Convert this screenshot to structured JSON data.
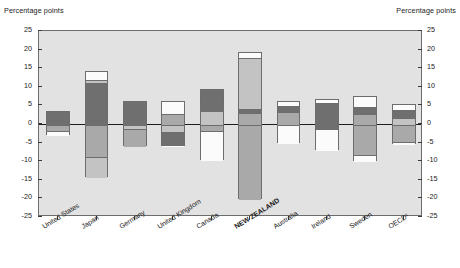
{
  "axis_titles": {
    "left": "Percentage points",
    "right": "Percentage points"
  },
  "chart_data": {
    "type": "bar",
    "subtype": "stacked-diverging",
    "title": "",
    "xlabel": "",
    "ylabel": "Percentage points",
    "ylim": [
      -25,
      25
    ],
    "yticks": [
      25,
      20,
      15,
      10,
      5,
      0,
      -5,
      -10,
      -15,
      -20,
      -25
    ],
    "ytick_labels": [
      "25",
      "20",
      "15",
      "10",
      "5",
      "0",
      "-5",
      "-10",
      "-15",
      "-20",
      "-25"
    ],
    "grid": false,
    "legend_position": "none",
    "categories": [
      "United States",
      "Japan",
      "Germany",
      "United Kingdom",
      "Canada",
      "NEW ZEALAND",
      "Australia",
      "Ireland",
      "Sweden",
      "OECD¹"
    ],
    "highlight_category": "NEW ZEALAND",
    "palette": {
      "white": "#fbfbfb",
      "light_gray": "#c3c3c3",
      "medium_gray": "#a9a9a9",
      "dark_gray": "#6f6f6f",
      "plot_background": "#e2e2e2",
      "outline": "#6d6d6d",
      "zero_line": "#1d1d1d",
      "text": "#1a1a1a"
    },
    "bars": [
      {
        "category": "United States",
        "total_positive": 3.4,
        "total_negative": -3.0,
        "segments": [
          {
            "from": 0.0,
            "to": 3.4,
            "color": "dark_gray"
          },
          {
            "from": -1.6,
            "to": 0.0,
            "color": "medium_gray"
          },
          {
            "from": -3.0,
            "to": -1.6,
            "color": "white"
          }
        ]
      },
      {
        "category": "Japan",
        "total_positive": 14.3,
        "total_negative": -14.2,
        "segments": [
          {
            "from": 12.0,
            "to": 14.3,
            "color": "white"
          },
          {
            "from": 11.4,
            "to": 12.0,
            "color": "light_gray"
          },
          {
            "from": 0.0,
            "to": 11.4,
            "color": "dark_gray"
          },
          {
            "from": -8.6,
            "to": 0.0,
            "color": "medium_gray"
          },
          {
            "from": -14.2,
            "to": -8.6,
            "color": "light_gray"
          }
        ]
      },
      {
        "category": "Germany",
        "total_positive": 6.2,
        "total_negative": -6.0,
        "segments": [
          {
            "from": 0.0,
            "to": 6.2,
            "color": "dark_gray"
          },
          {
            "from": -1.0,
            "to": 0.0,
            "color": "light_gray"
          },
          {
            "from": -6.0,
            "to": -1.0,
            "color": "medium_gray"
          }
        ]
      },
      {
        "category": "United Kingdom",
        "total_positive": 6.1,
        "total_negative": -6.0,
        "segments": [
          {
            "from": 2.9,
            "to": 6.1,
            "color": "white"
          },
          {
            "from": 0.0,
            "to": 2.9,
            "color": "medium_gray"
          },
          {
            "from": -2.0,
            "to": 0.0,
            "color": "light_gray"
          },
          {
            "from": -5.4,
            "to": -2.0,
            "color": "dark_gray"
          },
          {
            "from": -6.0,
            "to": -5.4,
            "color": "white"
          }
        ]
      },
      {
        "category": "Canada",
        "total_positive": 9.5,
        "total_negative": -9.6,
        "segments": [
          {
            "from": 3.8,
            "to": 9.5,
            "color": "dark_gray"
          },
          {
            "from": 0.0,
            "to": 3.8,
            "color": "light_gray"
          },
          {
            "from": -1.6,
            "to": 0.0,
            "color": "medium_gray"
          },
          {
            "from": -9.6,
            "to": -1.6,
            "color": "white"
          }
        ]
      },
      {
        "category": "NEW ZEALAND",
        "total_positive": 19.4,
        "total_negative": -20.2,
        "segments": [
          {
            "from": 18.0,
            "to": 19.4,
            "color": "white"
          },
          {
            "from": 4.2,
            "to": 18.0,
            "color": "light_gray"
          },
          {
            "from": 3.2,
            "to": 4.2,
            "color": "dark_gray"
          },
          {
            "from": 0.0,
            "to": 3.2,
            "color": "medium_gray"
          },
          {
            "from": -20.2,
            "to": 0.0,
            "color": "medium_gray"
          }
        ]
      },
      {
        "category": "Australia",
        "total_positive": 6.2,
        "total_negative": -5.0,
        "segments": [
          {
            "from": 5.0,
            "to": 6.2,
            "color": "white"
          },
          {
            "from": 3.4,
            "to": 5.0,
            "color": "dark_gray"
          },
          {
            "from": 0.0,
            "to": 3.4,
            "color": "medium_gray"
          },
          {
            "from": -5.0,
            "to": 0.0,
            "color": "white"
          }
        ]
      },
      {
        "category": "Ireland",
        "total_positive": 6.6,
        "total_negative": -6.9,
        "segments": [
          {
            "from": 6.0,
            "to": 6.6,
            "color": "white"
          },
          {
            "from": 0.0,
            "to": 6.0,
            "color": "dark_gray"
          },
          {
            "from": -1.1,
            "to": 0.0,
            "color": "dark_gray"
          },
          {
            "from": -6.9,
            "to": -1.1,
            "color": "white"
          }
        ]
      },
      {
        "category": "Sweden",
        "total_positive": 7.6,
        "total_negative": -10.0,
        "segments": [
          {
            "from": 4.9,
            "to": 7.6,
            "color": "white"
          },
          {
            "from": 3.0,
            "to": 4.9,
            "color": "dark_gray"
          },
          {
            "from": 0.0,
            "to": 3.0,
            "color": "medium_gray"
          },
          {
            "from": -8.0,
            "to": 0.0,
            "color": "medium_gray"
          },
          {
            "from": -10.0,
            "to": -8.0,
            "color": "white"
          }
        ]
      },
      {
        "category": "OECD¹",
        "total_positive": 5.3,
        "total_negative": -5.4,
        "segments": [
          {
            "from": 4.0,
            "to": 5.3,
            "color": "white"
          },
          {
            "from": 2.0,
            "to": 4.0,
            "color": "dark_gray"
          },
          {
            "from": 0.0,
            "to": 2.0,
            "color": "light_gray"
          },
          {
            "from": -4.6,
            "to": 0.0,
            "color": "medium_gray"
          },
          {
            "from": -5.4,
            "to": -4.6,
            "color": "white"
          }
        ]
      }
    ]
  }
}
